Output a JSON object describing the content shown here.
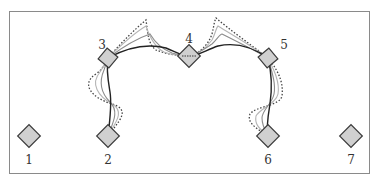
{
  "diagram": {
    "type": "node-path-diagram",
    "frame": {
      "stroke": "#8a8a8a"
    },
    "node_fill": "#d0d0d0",
    "node_stroke": "#3a3a3a",
    "nodes": [
      {
        "id": "1",
        "label": "1"
      },
      {
        "id": "2",
        "label": "2"
      },
      {
        "id": "3",
        "label": "3"
      },
      {
        "id": "4",
        "label": "4"
      },
      {
        "id": "5",
        "label": "5"
      },
      {
        "id": "6",
        "label": "6"
      },
      {
        "id": "7",
        "label": "7"
      }
    ],
    "path": {
      "description": "Trajectory 2 → 3 → 4 → 5 → 6 drawn with a solid final curve, two lighter gray intermediate curves, and a dotted initial curve",
      "styles": {
        "final": {
          "color": "#222222",
          "dash": "solid"
        },
        "intermediate_1": {
          "color": "#8c8c8c",
          "dash": "solid"
        },
        "intermediate_2": {
          "color": "#b5b5b5",
          "dash": "solid"
        },
        "initial": {
          "color": "#444444",
          "dash": "dotted"
        }
      }
    }
  }
}
